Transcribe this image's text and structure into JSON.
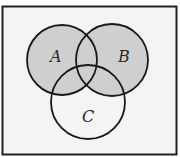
{
  "diagram": {
    "type": "venn",
    "shaded_region": "A ∪ B",
    "colors": {
      "background": "#f4f4f4",
      "shade": "#cfcfcf",
      "stroke": "#1a1a1a",
      "border": "#222222"
    },
    "universe": {
      "x": 2.5,
      "y": 6.5,
      "width": 174,
      "height": 148
    },
    "sets": [
      {
        "id": "A",
        "label": "A",
        "cx": 62,
        "cy": 60,
        "r": 35,
        "label_x": 56,
        "label_y": 62,
        "shaded": true
      },
      {
        "id": "B",
        "label": "B",
        "cx": 112,
        "cy": 60,
        "r": 36,
        "label_x": 122,
        "label_y": 62,
        "shaded": true
      },
      {
        "id": "C",
        "label": "C",
        "cx": 88,
        "cy": 102,
        "r": 37,
        "label_x": 84,
        "label_y": 122,
        "shaded": false
      }
    ]
  }
}
